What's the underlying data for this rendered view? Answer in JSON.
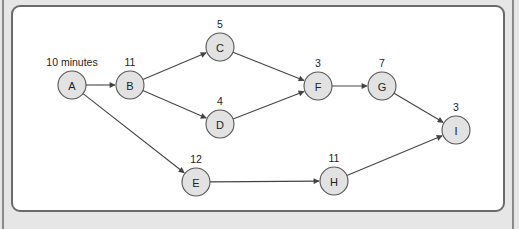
{
  "diagram": {
    "type": "activity-network",
    "nodes": [
      {
        "id": "A",
        "label": "A",
        "duration": "10 minutes"
      },
      {
        "id": "B",
        "label": "B",
        "duration": "11"
      },
      {
        "id": "C",
        "label": "C",
        "duration": "5"
      },
      {
        "id": "D",
        "label": "D",
        "duration": "4"
      },
      {
        "id": "E",
        "label": "E",
        "duration": "12"
      },
      {
        "id": "F",
        "label": "F",
        "duration": "3"
      },
      {
        "id": "G",
        "label": "G",
        "duration": "7"
      },
      {
        "id": "H",
        "label": "H",
        "duration": "11"
      },
      {
        "id": "I",
        "label": "I",
        "duration": "3"
      }
    ],
    "edges": [
      {
        "from": "A",
        "to": "B"
      },
      {
        "from": "A",
        "to": "E"
      },
      {
        "from": "B",
        "to": "C"
      },
      {
        "from": "B",
        "to": "D"
      },
      {
        "from": "C",
        "to": "F"
      },
      {
        "from": "D",
        "to": "F"
      },
      {
        "from": "F",
        "to": "G"
      },
      {
        "from": "G",
        "to": "I"
      },
      {
        "from": "E",
        "to": "H"
      },
      {
        "from": "H",
        "to": "I"
      }
    ],
    "colors": {
      "node_fill": "#e2e2e2",
      "node_stroke": "#555555",
      "edge": "#444444",
      "panel_bg": "#ffffff",
      "page_bg": "#e6e6e6"
    }
  }
}
